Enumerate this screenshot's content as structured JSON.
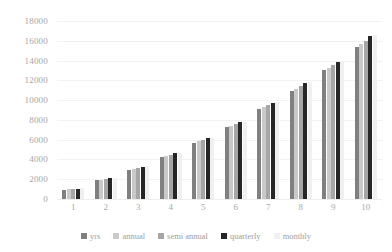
{
  "chart_data": {
    "type": "bar",
    "title": "",
    "subtitle": "",
    "xlabel": "",
    "ylabel": "",
    "categories": [
      "1",
      "2",
      "3",
      "4",
      "5",
      "6",
      "7",
      "8",
      "9",
      "10"
    ],
    "ylim": [
      0,
      18000
    ],
    "yticks": [
      0,
      2000,
      4000,
      6000,
      8000,
      10000,
      12000,
      14000,
      16000,
      18000
    ],
    "ytick_labels": [
      "0",
      "2000",
      "4000",
      "6000",
      "8000",
      "10000",
      "12000",
      "14000",
      "16000",
      "18000"
    ],
    "grid": true,
    "grid_axis": "y",
    "legend_position": "bottom",
    "series": [
      {
        "name": "yrs",
        "color": "#808080",
        "values": [
          950,
          1900,
          2950,
          4250,
          5700,
          7250,
          9100,
          10900,
          13000,
          15400
        ]
      },
      {
        "name": "annual",
        "color": "#c9c9c9",
        "values": [
          1000,
          1950,
          3050,
          4400,
          5850,
          7400,
          9300,
          11150,
          13250,
          15700
        ]
      },
      {
        "name": "semi annual",
        "color": "#a6a6a6",
        "values": [
          1030,
          2000,
          3150,
          4500,
          6000,
          7550,
          9500,
          11400,
          13550,
          16000
        ]
      },
      {
        "name": "quarterly",
        "color": "#262626",
        "values": [
          1060,
          2080,
          3250,
          4650,
          6150,
          7750,
          9700,
          11700,
          13900,
          16450
        ]
      },
      {
        "name": "monthly",
        "color": "#f0f0f0",
        "values": [
          1075,
          2100,
          3300,
          4700,
          6200,
          7820,
          9800,
          11800,
          14000,
          16600
        ]
      }
    ]
  },
  "axis": {
    "y_color": "#a6a6a6",
    "x_color": "#a8a8a8",
    "grid_color": "#f2f2f2"
  }
}
